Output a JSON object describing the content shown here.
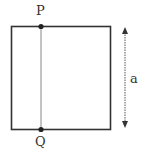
{
  "diagram": {
    "labels": {
      "top_point": "P",
      "bottom_point": "Q",
      "side_length": "a"
    },
    "colors": {
      "stroke": "#333333",
      "inner_line": "#888888",
      "arrow": "#555555"
    }
  }
}
